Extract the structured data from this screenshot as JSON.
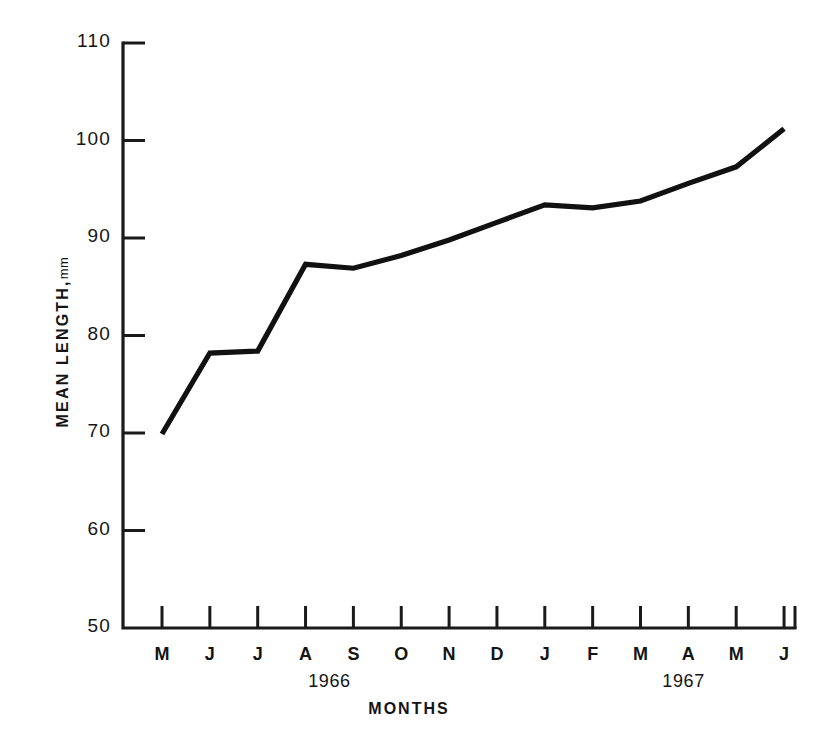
{
  "chart_data": {
    "type": "line",
    "title": "",
    "subtitle": "",
    "xlabel": "MONTHS",
    "ylabel": "MEAN LENGTH",
    "ylabel_unit": "mm",
    "ylim": [
      50,
      110
    ],
    "ytick_values": [
      110,
      100,
      90,
      80,
      70,
      60,
      50
    ],
    "ytick_labels": [
      "110",
      "100",
      "90",
      "80",
      "70",
      "60",
      "50"
    ],
    "grid": false,
    "legend": "none",
    "categories": [
      "M",
      "J",
      "J",
      "A",
      "S",
      "O",
      "N",
      "D",
      "J",
      "F",
      "M",
      "A",
      "M",
      "J"
    ],
    "x": [
      0,
      1,
      2,
      3,
      4,
      5,
      6,
      7,
      8,
      9,
      10,
      11,
      12,
      13
    ],
    "values": [
      69.9,
      78.2,
      78.4,
      87.3,
      86.9,
      88.2,
      89.8,
      91.6,
      93.4,
      93.1,
      93.8,
      95.6,
      97.3,
      101.2
    ],
    "series": [
      {
        "name": "Mean length",
        "color": "#111111",
        "values": [
          69.9,
          78.2,
          78.4,
          87.3,
          86.9,
          88.2,
          89.8,
          91.6,
          93.4,
          93.1,
          93.8,
          95.6,
          97.3,
          101.2
        ]
      }
    ],
    "group_labels": [
      {
        "text": "1966",
        "center_category_index": 3.5
      },
      {
        "text": "1967",
        "center_category_index": 10.9
      }
    ]
  },
  "axes": {
    "year_1966": "1966",
    "year_1967": "1967",
    "x_axis_title": "MONTHS",
    "y_axis_title": "MEAN LENGTH,",
    "y_axis_unit": "mm"
  },
  "colors": {
    "background": "#ffffff",
    "ink": "#111111",
    "axis": "#1a1a1a"
  }
}
